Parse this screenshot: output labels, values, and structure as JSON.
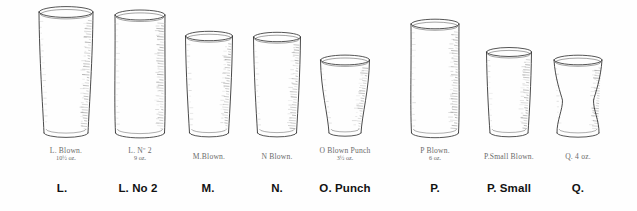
{
  "plate": {
    "title": "Glassware plate — tumblers L to Q",
    "background_color": "#fefefe",
    "ink_color": "#2b2b2b",
    "hand_label_color": "#6b6b6b",
    "caption_color": "#121212"
  },
  "glasses": [
    {
      "key": "L",
      "caption": "L.",
      "hand_label_line1": "L. Blown.",
      "hand_label_line2": "10½ oz.",
      "shape": "tapered-tumbler",
      "left": 36,
      "width": 60,
      "height": 124,
      "rim_width": 54,
      "base_width": 44,
      "caption_center": 62
    },
    {
      "key": "L No 2",
      "caption": "L. No 2",
      "hand_label_line1": "L. Nº 2",
      "hand_label_line2": "9 oz.",
      "shape": "straight-cylinder",
      "left": 112,
      "width": 56,
      "height": 121,
      "rim_width": 50,
      "base_width": 49,
      "caption_center": 138
    },
    {
      "key": "M",
      "caption": "M.",
      "hand_label_line1": "M.Blown.",
      "hand_label_line2": "",
      "shape": "tapered-tumbler",
      "left": 183,
      "width": 52,
      "height": 100,
      "rim_width": 47,
      "base_width": 39,
      "caption_center": 208
    },
    {
      "key": "N",
      "caption": "N.",
      "hand_label_line1": "N Blown.",
      "hand_label_line2": "",
      "shape": "tapered-tumbler",
      "left": 251,
      "width": 52,
      "height": 99,
      "rim_width": 47,
      "base_width": 39,
      "caption_center": 277
    },
    {
      "key": "O",
      "caption": "O. Punch",
      "hand_label_line1": "O Blown Punch",
      "hand_label_line2": "3½ oz.",
      "shape": "conical-punch",
      "left": 318,
      "width": 54,
      "height": 76,
      "rim_width": 49,
      "base_width": 32,
      "caption_center": 345
    },
    {
      "key": "P",
      "caption": "P.",
      "hand_label_line1": "P Blown.",
      "hand_label_line2": "6 oz.",
      "shape": "straight-cylinder",
      "left": 408,
      "width": 54,
      "height": 112,
      "rim_width": 48,
      "base_width": 47,
      "caption_center": 435
    },
    {
      "key": "P Small",
      "caption": "P. Small",
      "hand_label_line1": "P.Small Blown.",
      "hand_label_line2": "",
      "shape": "tapered-tumbler",
      "left": 484,
      "width": 50,
      "height": 84,
      "rim_width": 45,
      "base_width": 38,
      "caption_center": 509
    },
    {
      "key": "Q",
      "caption": "Q.",
      "hand_label_line1": "Q. 4 oz.",
      "hand_label_line2": "",
      "shape": "waisted-flared",
      "left": 551,
      "width": 54,
      "height": 76,
      "rim_width": 48,
      "base_width": 42,
      "caption_center": 578
    }
  ]
}
